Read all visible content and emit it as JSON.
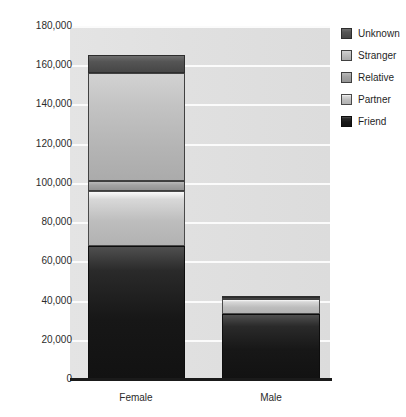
{
  "chart_data": {
    "type": "bar",
    "subtype": "stacked-vertical",
    "title": "",
    "xlabel": "",
    "ylabel": "",
    "categories": [
      "Female",
      "Male"
    ],
    "ylim": [
      0,
      180000
    ],
    "ytick_step": 20000,
    "ytick_labels": [
      "180,000",
      "160,000",
      "140,000",
      "120,000",
      "100,000",
      "80,000",
      "60,000",
      "40,000",
      "20,000",
      "0"
    ],
    "ytick_values": [
      180000,
      160000,
      140000,
      120000,
      100000,
      80000,
      60000,
      40000,
      20000,
      0
    ],
    "grid": true,
    "grid_axis": "y",
    "legend_position": "right",
    "stack_order_bottom_to_top": [
      "Friend",
      "Partner",
      "Relative",
      "Stranger",
      "Unknown"
    ],
    "series": [
      {
        "name": "Friend",
        "color": "#141414",
        "values": [
          68000,
          33000
        ]
      },
      {
        "name": "Partner",
        "color": "#c6c6c6",
        "values": [
          28000,
          8000
        ]
      },
      {
        "name": "Relative",
        "color": "#a2a2a2",
        "values": [
          5000,
          500
        ]
      },
      {
        "name": "Stranger",
        "color": "#bcbcbc",
        "values": [
          55000,
          500
        ]
      },
      {
        "name": "Unknown",
        "color": "#4f4f4f",
        "values": [
          9000,
          500
        ]
      }
    ],
    "totals": [
      165000,
      42500
    ]
  },
  "legend": {
    "items": [
      {
        "label": "Unknown",
        "color": "#4f4f4f"
      },
      {
        "label": "Stranger",
        "color": "#bcbcbc"
      },
      {
        "label": "Relative",
        "color": "#a2a2a2"
      },
      {
        "label": "Partner",
        "color": "#c6c6c6"
      },
      {
        "label": "Friend",
        "color": "#141414"
      }
    ]
  },
  "style": {
    "plot_background": "#e0e0e0",
    "gridline_color": "#fbfbfb",
    "axis_color": "#1a1a1a",
    "text_color": "#2b2b2b",
    "page_background": "#ffffff"
  }
}
